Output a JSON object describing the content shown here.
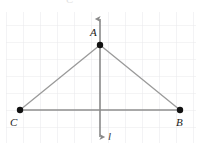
{
  "figure": {
    "type": "geometry-diagram",
    "background_color": "#ffffff",
    "grid": {
      "visible": true,
      "color": "#e9eaec",
      "cell_size": 17,
      "x_start": 6,
      "x_end": 196,
      "y_start": 12,
      "y_end": 143
    },
    "points": [
      {
        "name": "A",
        "label": "A",
        "x": 100,
        "y": 45,
        "label_x": 90,
        "label_y": 36,
        "dot_color": "#111111",
        "dot_radius": 3.2
      },
      {
        "name": "C",
        "label": "C",
        "x": 20,
        "y": 110,
        "label_x": 10,
        "label_y": 126,
        "dot_color": "#111111",
        "dot_radius": 3.2
      },
      {
        "name": "B",
        "label": "B",
        "x": 180,
        "y": 110,
        "label_x": 176,
        "label_y": 126,
        "dot_color": "#111111",
        "dot_radius": 3.2
      }
    ],
    "segments": [
      {
        "name": "segment-CA",
        "from": "C",
        "to": "A",
        "x1": 20,
        "y1": 110,
        "x2": 100,
        "y2": 45,
        "color": "#9a9a9a",
        "width": 1.3
      },
      {
        "name": "segment-AB",
        "from": "A",
        "to": "B",
        "x1": 100,
        "y1": 45,
        "x2": 180,
        "y2": 110,
        "color": "#9a9a9a",
        "width": 1.3
      },
      {
        "name": "segment-CB",
        "from": "C",
        "to": "B",
        "x1": 20,
        "y1": 110,
        "x2": 180,
        "y2": 110,
        "color": "#8e8e8e",
        "width": 1.3
      }
    ],
    "symmetry_line": {
      "name": "line-l",
      "label": "l",
      "x": 100,
      "y_top": 14,
      "y_bottom": 142,
      "color": "#8a8a8a",
      "width": 1.6,
      "arrows": "both",
      "label_x": 108,
      "label_y": 140
    },
    "clipped_top_glyph": "C"
  }
}
